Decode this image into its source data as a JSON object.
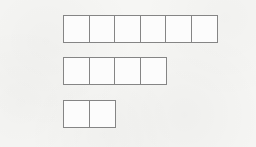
{
  "diagram": {
    "kind": "bar-model-strips",
    "rows": [
      {
        "cells": 6
      },
      {
        "cells": 4
      },
      {
        "cells": 2
      }
    ],
    "colors": {
      "border": "#858585",
      "cell_fill": "#fcfcfc",
      "background": "#f6f6f4"
    }
  }
}
